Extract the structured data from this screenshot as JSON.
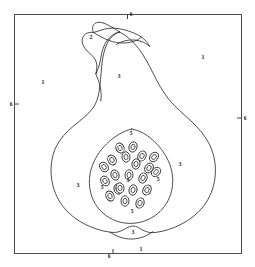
{
  "figure": {
    "frame": {
      "stroke_color": "#3a3a3a",
      "fill_color": "#ffffff",
      "x": 14,
      "y": 14,
      "width": 228,
      "height": 240
    },
    "line_color": "#2e2e2e",
    "background_color": "#ffffff"
  },
  "legend_key": [
    {
      "code": "1",
      "meaning": "background outside fruit"
    },
    {
      "code": "2",
      "meaning": "stem / peduncle"
    },
    {
      "code": "3",
      "meaning": "flesh / mesocarp"
    },
    {
      "code": "5",
      "meaning": "seed cavity / placenta"
    },
    {
      "code": "6",
      "meaning": "frame border tick"
    }
  ],
  "region_labels": [
    {
      "text": "1",
      "x": 43,
      "y": 82,
      "region": "background-left"
    },
    {
      "text": "1",
      "x": 203,
      "y": 57,
      "region": "background-right"
    },
    {
      "text": "1",
      "x": 141,
      "y": 249,
      "region": "background-bottom"
    },
    {
      "text": "2",
      "x": 91,
      "y": 37,
      "region": "stem"
    },
    {
      "text": "3",
      "x": 119,
      "y": 76,
      "region": "flesh-neck"
    },
    {
      "text": "3",
      "x": 78,
      "y": 185,
      "region": "flesh-left"
    },
    {
      "text": "3",
      "x": 180,
      "y": 164,
      "region": "flesh-right"
    },
    {
      "text": "3",
      "x": 133,
      "y": 232,
      "region": "flesh-base"
    }
  ],
  "cavity_labels": [
    {
      "text": "5",
      "x": 131,
      "y": 134,
      "region": "cavity-top"
    },
    {
      "text": "5",
      "x": 102,
      "y": 188,
      "region": "cavity-left"
    },
    {
      "text": "5",
      "x": 128,
      "y": 181,
      "region": "cavity-center"
    },
    {
      "text": "5",
      "x": 158,
      "y": 180,
      "region": "cavity-right"
    },
    {
      "text": "5",
      "x": 132,
      "y": 212,
      "region": "cavity-bottom"
    }
  ],
  "border_labels": [
    {
      "text": "6",
      "x": 131,
      "y": 15,
      "side": "top"
    },
    {
      "text": "6",
      "x": 11,
      "y": 105,
      "side": "left"
    },
    {
      "text": "6",
      "x": 245,
      "y": 119,
      "side": "right"
    },
    {
      "text": "6",
      "x": 109,
      "y": 257,
      "side": "bottom"
    }
  ],
  "shapes": {
    "fruit_outline": "M 119.5 32 C 113 34 108.5 39.5 106 46 C 103.5 52.5 102.2 60 101.5 68 C 100.8 76 100.3 84 99.2 91 C 98.1 98 96.2 103.5 93 108 C 88 115 80.5 120 73.5 126 C 66.5 132 60 138.5 56 147 C 51.5 156.5 50.2 167.5 51.5 178 C 52.8 188.5 56.8 198.5 63 206.5 C 69 214.3 77 220.3 85.5 224.5 C 93.5 228.5 102 231 110 232.2 C 115.5 233 119.5 232 123 230 C 126.5 228 129.5 226 133 226 C 136.5 226 139 228 142.5 230 C 146 232 150.5 233.2 156 232.4 C 164.5 231.2 173 228.5 181 224.4 C 189.5 220 197.5 214 203.5 206.2 C 209.8 198 213.8 188 215 177.5 C 216.3 166.5 214.5 155 210 145.5 C 205.5 136 198.5 128 191 121 C 183.5 114 175.5 107.5 169 99.5 C 162.5 91.5 157.5 82 153 73 C 148.5 64 144 55.5 138.5 48.5 C 133.5 42 127 35.5 119.5 32 Z",
    "stem": "M 119.5 32 C 116 29.5 112 27 108 25 C 104.5 23.2 101 22 98 22.3 C 95.5 22.6 93.8 24 93 26 C 92.2 28 92.5 30.5 93.5 32.5 C 90.5 32 87.5 32.5 85.5 34 C 83 35.8 81.8 38.8 82.2 42 C 82.6 45.5 84.8 48.5 87.2 51 C 89.5 53.3 92 55.2 93.8 57.5 C 95.5 59.7 96.5 62.2 96.8 65 C 97 68 96.5 71 95.8 74 C 97.5 70.5 99 66.5 100 62 C 101 57.5 101.5 52.5 103.2 48 C 105 43 108 38.5 112 35.5 C 114.2 33.8 116.8 32.6 119.5 32 Z",
    "stem_inner": "M 93.5 32.5 C 96 34 98.5 35.5 101 36.8 C 106 39.5 111 41.6 116.5 42.5 C 122 43.4 128 43.2 133.5 41.5 C 136.5 40.5 139.2 39 141.5 37 C 137.5 34.5 133 32.5 128.5 31 C 124 29.5 119.3 28.5 114.5 28.2 C 110 28 105.5 28.5 101.5 30 C 98.5 31 95.8 31.8 93.5 32.5 Z",
    "stem_neck": "M 141.5 37 C 144.5 39.5 147 42.5 149 46 C 147 44 144.5 42.5 141.8 41.5 C 138 40 133.8 39.6 129.8 40 C 125.5 40.4 121.5 41.5 118 43.5 C 121 42 124.5 41.2 128 41 C 132.5 40.8 137 41.5 141 43 C 141.2 41 141.3 39 141.5 37 Z",
    "cavity_outline": "M 131.5 129 C 122 131.5 113.5 137 106.5 144 C 99.5 151 94 159.5 91.2 169 C 88.5 178.2 88.8 188.2 92 197 C 95.2 205.8 101.5 213.2 109.5 217.8 C 117.5 222.5 127 224.3 136 223 C 145 221.8 153.5 217.8 160 211.5 C 166.5 205.2 170.8 196.8 172.2 187.8 C 173.6 178.8 172.2 169.5 168.5 161.2 C 164.8 152.8 159 145.5 152.2 139.5 C 146 134 139 130.2 131.5 129 Z",
    "base_notch": "M 110 232.2 C 114 235 118 237.2 122.5 238.5 C 127 239.8 132 240 137 239 C 142 238 146.8 235.8 151 232.8 C 152.8 231.5 154.5 230 156 228.5"
  },
  "seeds": [
    {
      "cx": 120,
      "cy": 148,
      "rx": 4.0,
      "ry": 5.2,
      "rot": -22
    },
    {
      "cx": 133,
      "cy": 147,
      "rx": 4.0,
      "ry": 5.2,
      "rot": 18
    },
    {
      "cx": 112,
      "cy": 160,
      "rx": 4.0,
      "ry": 5.2,
      "rot": -30
    },
    {
      "cx": 126,
      "cy": 157,
      "rx": 4.0,
      "ry": 5.2,
      "rot": -8
    },
    {
      "cx": 142,
      "cy": 156,
      "rx": 4.0,
      "ry": 5.2,
      "rot": 28
    },
    {
      "cx": 154,
      "cy": 157,
      "rx": 4.0,
      "ry": 5.2,
      "rot": 40
    },
    {
      "cx": 104,
      "cy": 167,
      "rx": 4.0,
      "ry": 5.2,
      "rot": -38
    },
    {
      "cx": 136,
      "cy": 164,
      "rx": 4.0,
      "ry": 5.2,
      "rot": 10
    },
    {
      "cx": 149,
      "cy": 168,
      "rx": 4.0,
      "ry": 5.2,
      "rot": 34
    },
    {
      "cx": 115,
      "cy": 175,
      "rx": 4.0,
      "ry": 5.2,
      "rot": -18
    },
    {
      "cx": 129,
      "cy": 175,
      "rx": 4.0,
      "ry": 5.2,
      "rot": 4
    },
    {
      "cx": 143,
      "cy": 178,
      "rx": 4.0,
      "ry": 5.2,
      "rot": 26
    },
    {
      "cx": 156,
      "cy": 172,
      "rx": 4.0,
      "ry": 5.2,
      "rot": 44
    },
    {
      "cx": 105,
      "cy": 181,
      "rx": 4.0,
      "ry": 5.2,
      "rot": -34
    },
    {
      "cx": 118,
      "cy": 189,
      "rx": 4.0,
      "ry": 5.2,
      "rot": -14
    },
    {
      "cx": 133,
      "cy": 190,
      "rx": 4.0,
      "ry": 5.2,
      "rot": 12
    },
    {
      "cx": 147,
      "cy": 190,
      "rx": 4.0,
      "ry": 5.2,
      "rot": 30
    },
    {
      "cx": 110,
      "cy": 196,
      "rx": 4.0,
      "ry": 5.2,
      "rot": -24
    },
    {
      "cx": 125,
      "cy": 201,
      "rx": 4.0,
      "ry": 5.2,
      "rot": 0
    },
    {
      "cx": 140,
      "cy": 203,
      "rx": 4.0,
      "ry": 5.2,
      "rot": 22
    },
    {
      "cx": 120,
      "cy": 188,
      "rx": 4.0,
      "ry": 5.2,
      "rot": -6
    }
  ]
}
